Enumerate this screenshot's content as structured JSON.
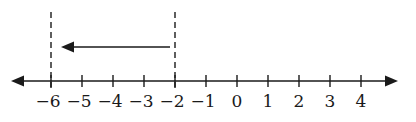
{
  "diagram": {
    "type": "number-line",
    "axis": {
      "min": -6,
      "max": 4,
      "tick_values": [
        -6,
        -5,
        -4,
        -3,
        -2,
        -1,
        0,
        1,
        2,
        3,
        4
      ],
      "tick_labels": [
        "−6",
        "−5",
        "−4",
        "−3",
        "−2",
        "−1",
        "0",
        "1",
        "2",
        "3",
        "4"
      ],
      "arrows": "both-ends"
    },
    "dashed_markers": [
      {
        "value": -6,
        "label": "−6"
      },
      {
        "value": -2,
        "label": "−2"
      }
    ],
    "displacement_arrow": {
      "from": -2,
      "to": -6,
      "direction": "left",
      "change": -4
    },
    "colors": {
      "line": "#1a1a1a",
      "background": "#ffffff"
    }
  }
}
